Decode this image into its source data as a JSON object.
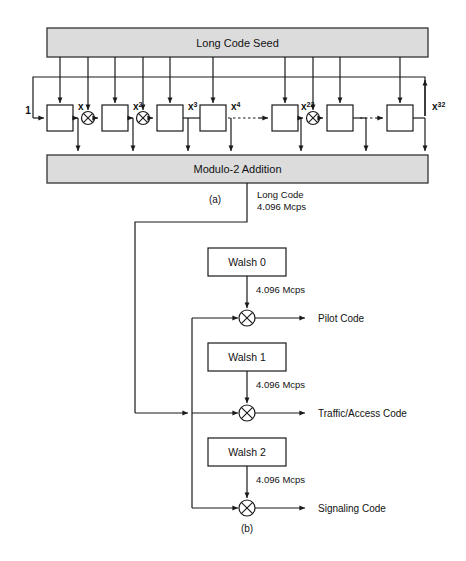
{
  "figure": {
    "title_a_caption": "(a)",
    "title_b_caption": "(b)"
  },
  "part_a": {
    "seed_box_label": "Long Code Seed",
    "modulo_box_label": "Modulo-2 Addition",
    "input_label": "1",
    "tap_labels": [
      "x",
      "x",
      "x",
      "x",
      "x",
      "x"
    ],
    "tap_exponents": [
      "",
      "2",
      "3",
      "4",
      "22",
      "32"
    ],
    "tap_display": [
      "x",
      "x2",
      "x3",
      "x4",
      "x22",
      "x32"
    ],
    "register_count": 8,
    "xor_count": 3,
    "ellipsis_count": 2
  },
  "part_b": {
    "long_code_label_line1": "Long Code",
    "long_code_label_line2": "4.096 Mcps",
    "branches": [
      {
        "walsh_label": "Walsh 0",
        "rate_label": "4.096 Mcps",
        "output_label": "Pilot Code"
      },
      {
        "walsh_label": "Walsh 1",
        "rate_label": "4.096 Mcps",
        "output_label": "Traffic/Access Code"
      },
      {
        "walsh_label": "Walsh 2",
        "rate_label": "4.096 Mcps",
        "output_label": "Signaling Code"
      }
    ]
  },
  "colors": {
    "band_fill": "#dcdcdc",
    "line": "#1a1a1a",
    "box_fill": "#ffffff",
    "background": "#ffffff"
  }
}
